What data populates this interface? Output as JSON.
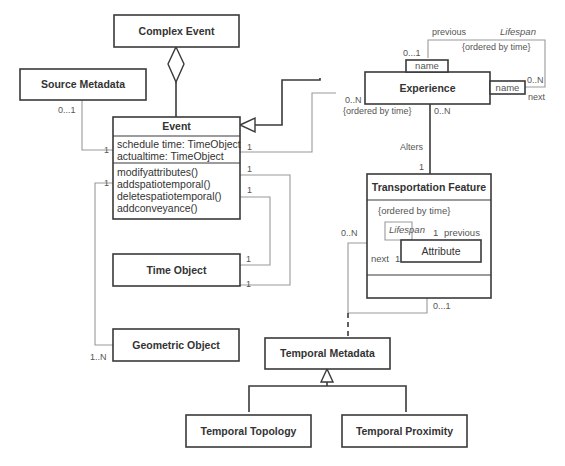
{
  "classes": {
    "complex_event": "Complex Event",
    "source_metadata": "Source Metadata",
    "event": "Event",
    "experience": "Experience",
    "transportation_feature": "Transportation Feature",
    "time_object": "Time Object",
    "geometric_object": "Geometric Object",
    "temporal_metadata": "Temporal Metadata",
    "temporal_topology": "Temporal Topology",
    "temporal_proximity": "Temporal Proximity",
    "attribute": "Attribute"
  },
  "event": {
    "attributes": [
      "schedule time: TimeObject",
      "actualtime: TimeObject"
    ],
    "operations": [
      "modifyattributes()",
      "addspatiotemporal()",
      "deletespatiotemporal()",
      "addconveyance()"
    ]
  },
  "experience": {
    "qualifier_top": "name",
    "qualifier_right": "name",
    "previous": "previous",
    "next": "next",
    "lifespan": "Lifespan",
    "ordered": "{ordered by time}",
    "mult_prev": "0...1",
    "mult_next": "0..N",
    "mult_event_side": "0..N",
    "ordered_event": "{ordered by time}",
    "mult_down": "0..N"
  },
  "transportation": {
    "ordered": "{ordered by time}",
    "lifespan": "Lifespan",
    "previous": "previous",
    "next": "next",
    "mult_prev": "1",
    "mult_next": "1",
    "mult_left": "0..N",
    "mult_bottom": "0...1"
  },
  "associations": {
    "alters": "Alters",
    "alters_mult": "1",
    "source_mult": "0...1",
    "event_source_mult": "1",
    "event_exp_mult": "1",
    "event_time1_mult": "1",
    "event_time2_mult": "1",
    "time1_mult": "1",
    "time2_mult": "1",
    "event_geo_mult": "1",
    "geo_mult": "1..N"
  }
}
